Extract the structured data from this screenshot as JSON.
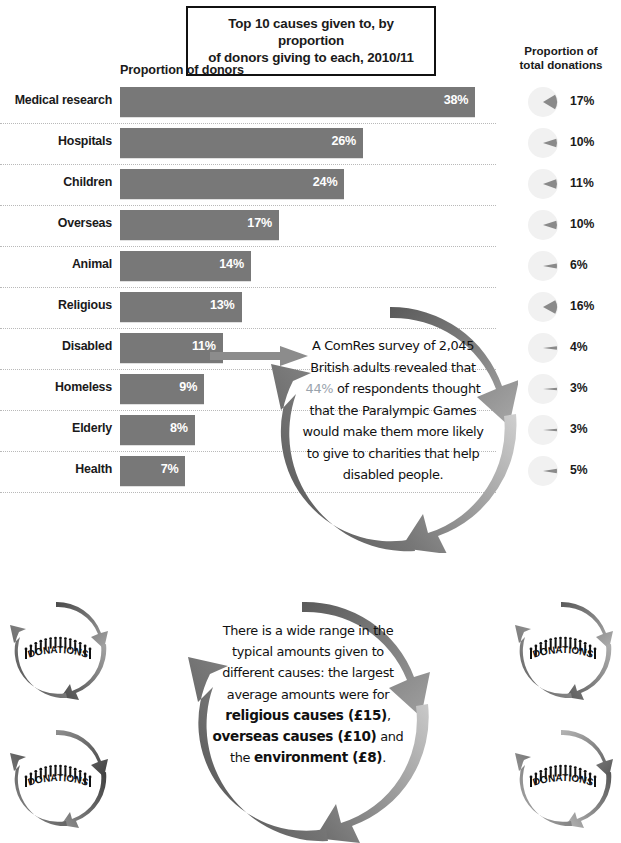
{
  "title": {
    "line1": "Top 10 causes given to, by proportion",
    "line2": "of donors giving to each, 2010/11"
  },
  "headers": {
    "left": "Proportion of donors",
    "right_line1": "Proportion of",
    "right_line2": "total donations"
  },
  "chart_data": {
    "type": "bar",
    "title": "Top 10 causes given to, by proportion of donors giving to each, 2010/11",
    "xlabel": "",
    "ylabel": "",
    "orientation": "horizontal",
    "grid": "dotted-row-separators",
    "categories": [
      "Medical research",
      "Hospitals",
      "Children",
      "Overseas",
      "Animal",
      "Religious",
      "Disabled",
      "Homeless",
      "Elderly",
      "Health"
    ],
    "series": [
      {
        "name": "Proportion of donors",
        "unit": "%",
        "values": [
          38,
          26,
          24,
          17,
          14,
          13,
          11,
          9,
          8,
          7
        ],
        "labels": [
          "38%",
          "26%",
          "24%",
          "17%",
          "14%",
          "13%",
          "11%",
          "9%",
          "8%",
          "7%"
        ]
      },
      {
        "name": "Proportion of total donations",
        "unit": "%",
        "render": "pie-wedge",
        "values": [
          17,
          10,
          11,
          10,
          6,
          16,
          4,
          3,
          3,
          5
        ],
        "labels": [
          "17%",
          "10%",
          "11%",
          "10%",
          "6%",
          "16%",
          "4%",
          "3%",
          "3%",
          "5%"
        ]
      }
    ],
    "xlim": [
      0,
      38
    ],
    "bar_color": "#787878",
    "value_label_color": "#ffffff"
  },
  "callouts": {
    "survey": {
      "prefix": "A ComRes survey of 2,045 British adults revealed that ",
      "highlight": "44%",
      "suffix": " of respondents thought that the Paralympic Games would make them more likely to give to charities that help disabled people.",
      "highlight_color": "#9aa3ad",
      "full_text": "A ComRes survey of 2,045 British adults revealed that 44% of respondents thought that the Paralympic Games would make them more likely to give to charities that help disabled people."
    },
    "amounts": {
      "part1": "There is a wide range in the typical amounts given to different causes: the largest average amounts were for ",
      "bold1": "religious causes (£15)",
      "mid1": ", ",
      "bold2": "overseas causes (£10)",
      "mid2": " and the ",
      "bold3": "environment (£8)",
      "tail": ".",
      "full_text": "There is a wide range in the typical amounts given to different causes: the largest average amounts were for religious causes (£15), overseas causes (£10) and the environment (£8)."
    }
  },
  "logos": {
    "label": "DONATIONS",
    "count": 4
  }
}
